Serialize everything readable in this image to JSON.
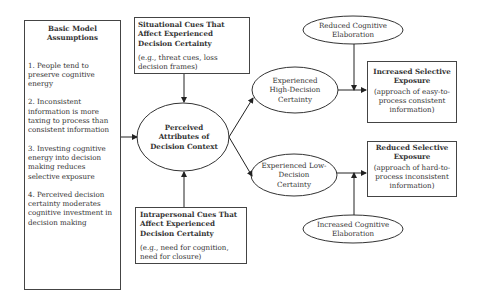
{
  "assumptions": {
    "title": "Basic Model Assumptions",
    "items": [
      "1. People tend to preserve cognitive energy",
      "2. Inconsistent information is more taxing to process than consistent information",
      "3. Investing cognitive energy into decision making reduces selective exposure",
      "4. Perceived decision certainty moderates cognitive investment in decision making"
    ]
  },
  "situational": {
    "title": "Situational Cues That Affect Experienced Decision Certainty",
    "examples": "(e.g., threat cues, loss decision frames)"
  },
  "intrapersonal": {
    "title": "Intrapersonal Cues That Affect Experienced Decision Certainty",
    "examples": "(e.g., need for cognition, need for closure)"
  },
  "center": {
    "label": "Perceived Attributes of Decision Context"
  },
  "high_certainty": {
    "label": "Experienced High-Decision Certainty"
  },
  "low_certainty": {
    "label": "Experienced Low-Decision Certainty"
  },
  "reduced_elaboration": {
    "label": "Reduced Cognitive Elaboration"
  },
  "increased_elaboration": {
    "label": "Increased Cognitive Elaboration"
  },
  "increased_exposure": {
    "title": "Increased Selective Exposure",
    "desc": "(approach of easy-to-process consistent information)"
  },
  "reduced_exposure": {
    "title": "Reduced Selective Exposure",
    "desc": "(approach of hard-to-process inconsistent information)"
  }
}
